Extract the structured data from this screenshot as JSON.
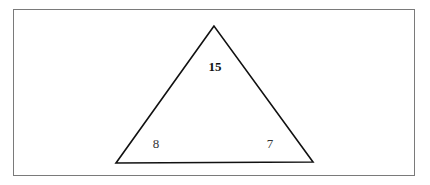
{
  "diagram": {
    "shape": "triangle",
    "labels": {
      "top": "15",
      "bottom_left": "8",
      "bottom_right": "7"
    },
    "colors": {
      "frame": "#7a7a7a",
      "stroke": "#111111"
    }
  }
}
